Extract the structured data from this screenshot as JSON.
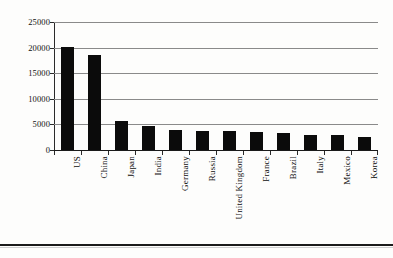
{
  "chart_data": {
    "type": "bar",
    "title": "",
    "subtitle": "",
    "xlabel": "",
    "ylabel": "",
    "ylim": [
      0,
      25000
    ],
    "ytick_values": [
      0,
      5000,
      10000,
      15000,
      20000,
      25000
    ],
    "ytick_labels": [
      "0",
      "5000",
      "10000",
      "15000",
      "20000",
      "25000"
    ],
    "grid": true,
    "legend": false,
    "legend_position": "none",
    "orientation": "vertical",
    "bar_color": "#0b0b0b",
    "gridline_color": "#8a8a8a",
    "axis_color": "#2a2a2a",
    "categories": [
      "US",
      "China",
      "Japan",
      "India",
      "Germany",
      "Russia",
      "United Kingdom",
      "France",
      "Brazil",
      "Italy",
      "Mexico",
      "Korea"
    ],
    "values": [
      20200,
      18600,
      5700,
      4600,
      3950,
      3750,
      3750,
      3500,
      3350,
      2850,
      2900,
      2500
    ]
  }
}
